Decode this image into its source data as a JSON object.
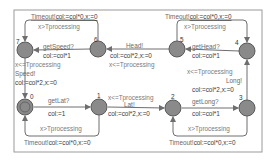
{
  "diagram": {
    "type": "timed-automaton",
    "frame": {
      "x": 14,
      "y": 10,
      "w": 248,
      "h": 142
    },
    "colors": {
      "node_fill": "#8a8a8a",
      "node_stroke": "#5a5a5a",
      "edge": "#6e6e6e",
      "frame": "#9a9a9a"
    },
    "locations": [
      {
        "id": "0",
        "x": 25,
        "y": 107,
        "initial": true,
        "label_dx": 5,
        "label_dy": -8
      },
      {
        "id": "1",
        "x": 99,
        "y": 107,
        "initial": false,
        "label_dx": -2,
        "label_dy": -9
      },
      {
        "id": "2",
        "x": 173,
        "y": 108,
        "initial": false,
        "label_dx": -2,
        "label_dy": -9
      },
      {
        "id": "3",
        "x": 247,
        "y": 108,
        "initial": false,
        "label_dx": -8,
        "label_dy": -8
      },
      {
        "id": "4",
        "x": 247,
        "y": 51,
        "initial": false,
        "label_dx": -12,
        "label_dy": -6
      },
      {
        "id": "5",
        "x": 177,
        "y": 49,
        "initial": false,
        "label_dx": 3,
        "label_dy": -7
      },
      {
        "id": "6",
        "x": 98,
        "y": 49,
        "initial": false,
        "label_dx": -4,
        "label_dy": -7
      },
      {
        "id": "7",
        "x": 25,
        "y": 50,
        "initial": false,
        "label_dx": -9,
        "label_dy": -6
      }
    ],
    "labels": {
      "timeout_tl": {
        "sync": "Timeout!",
        "assign": "col:=col*0,x:=0"
      },
      "guard_tl": "x>Tprocessing",
      "timeout_tr": {
        "sync": "Timeout!",
        "assign": "col:=col*0,x:=0"
      },
      "guard_tr": "x>Tprocessing",
      "get_speed": {
        "sync": "getSpeed?",
        "assign": "col:=col*1"
      },
      "head": {
        "sync": "Head!",
        "assign": "col:=col*2,x:=0",
        "invariant": "x<=Tprocessing"
      },
      "get_head": {
        "sync": "getHead?",
        "assign": "col:=col*1"
      },
      "speed": {
        "invariant": "x<=Tprocessing",
        "sync": "Speed!",
        "assign": "col:=col*2,x:=0"
      },
      "long": {
        "invariant": "x<=Tprocessing",
        "sync": "Long!",
        "assign": "col:=col*2,x:=0"
      },
      "get_lat": {
        "sync": "getLat?",
        "assign": "col:=1"
      },
      "lat": {
        "invariant": "x<=Tprocessing",
        "sync": "Lat!",
        "assign": "col:=col*2,x:=0"
      },
      "get_long": {
        "sync": "getLong?",
        "assign": "col:=col*1"
      },
      "guard_bl": "x>Tprocessing",
      "timeout_bl": {
        "sync": "Timeout!",
        "assign": "col:=col*0,x:=0"
      },
      "guard_br": "x>Tprocessing",
      "timeout_br": {
        "sync": "Timeout!",
        "assign": "col:=col*0,x:=0"
      }
    }
  }
}
